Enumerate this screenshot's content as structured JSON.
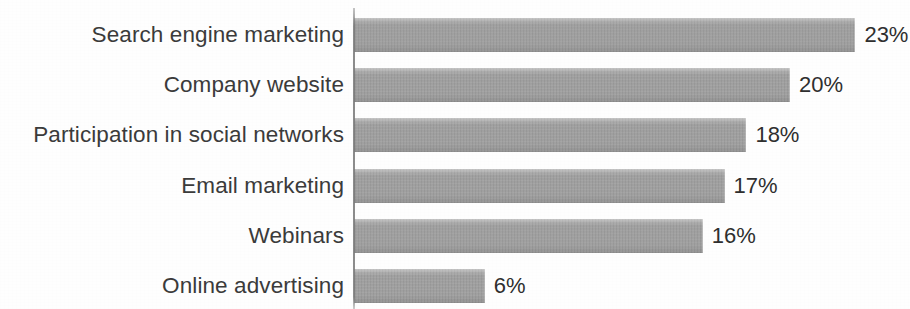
{
  "chart_data": {
    "type": "bar",
    "orientation": "horizontal",
    "title": "",
    "subtitle": "",
    "xlabel": "",
    "ylabel": "",
    "grid": false,
    "legend": false,
    "legend_position": "none",
    "axis_line": "vertical category axis at left of bars",
    "value_suffix": "%",
    "xlim": [
      0,
      23
    ],
    "categories": [
      "Search engine marketing",
      "Company website",
      "Participation in social networks",
      "Email marketing",
      "Webinars",
      "Online advertising"
    ],
    "values": [
      23,
      20,
      18,
      17,
      16,
      6
    ],
    "value_labels": [
      "23%",
      "20%",
      "18%",
      "17%",
      "16%",
      "6%"
    ],
    "bar_color": "#9d9d9d",
    "label_color": "#3b3b3b",
    "value_label_color": "#2f2f2f",
    "background_color": "#fefefe"
  },
  "bars": [
    {
      "category": "Search engine marketing",
      "value": 23,
      "label": "23%"
    },
    {
      "category": "Company website",
      "value": 20,
      "label": "20%"
    },
    {
      "category": "Participation in social networks",
      "value": 18,
      "label": "18%"
    },
    {
      "category": "Email marketing",
      "value": 17,
      "label": "17%"
    },
    {
      "category": "Webinars",
      "value": 16,
      "label": "16%"
    },
    {
      "category": "Online advertising",
      "value": 6,
      "label": "6%"
    }
  ]
}
